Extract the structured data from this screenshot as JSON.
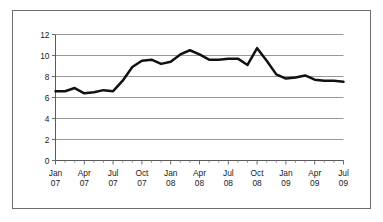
{
  "figure": {
    "background_color": "#ffffff",
    "frame_color": "#6e6e6e",
    "has_outer_border": true
  },
  "chart_data": {
    "type": "line",
    "title": "",
    "subtitle": "",
    "xlabel": "",
    "ylabel": "",
    "ylim": [
      0,
      12
    ],
    "y_ticks": [
      0,
      2,
      4,
      6,
      8,
      10,
      12
    ],
    "y_tick_labels": [
      "0",
      "2",
      "4",
      "6",
      "8",
      "10",
      "12"
    ],
    "grid": "horizontal",
    "legend": "none",
    "line_color": "#111111",
    "line_width": 2.5,
    "x_tick_labels": [
      {
        "month": "Jan",
        "year": "07"
      },
      {
        "month": "Apr",
        "year": "07"
      },
      {
        "month": "Jul",
        "year": "07"
      },
      {
        "month": "Oct",
        "year": "07"
      },
      {
        "month": "Jan",
        "year": "08"
      },
      {
        "month": "Apr",
        "year": "08"
      },
      {
        "month": "Jul",
        "year": "08"
      },
      {
        "month": "Oct",
        "year": "08"
      },
      {
        "month": "Jan",
        "year": "09"
      },
      {
        "month": "Apr",
        "year": "09"
      },
      {
        "month": "Jul",
        "year": "09"
      }
    ],
    "x": [
      "Jan 07",
      "Feb 07",
      "Mar 07",
      "Apr 07",
      "May 07",
      "Jun 07",
      "Jul 07",
      "Aug 07",
      "Sep 07",
      "Oct 07",
      "Nov 07",
      "Dec 07",
      "Jan 08",
      "Feb 08",
      "Mar 08",
      "Apr 08",
      "May 08",
      "Jun 08",
      "Jul 08",
      "Aug 08",
      "Sep 08",
      "Oct 08",
      "Nov 08",
      "Dec 08",
      "Jan 09",
      "Feb 09",
      "Mar 09",
      "Apr 09",
      "May 09",
      "Jun 09",
      "Jul 09"
    ],
    "values": [
      6.6,
      6.6,
      6.9,
      6.4,
      6.5,
      6.7,
      6.6,
      7.6,
      8.9,
      9.5,
      9.6,
      9.2,
      9.4,
      10.1,
      10.5,
      10.1,
      9.6,
      9.6,
      9.7,
      9.7,
      9.1,
      10.7,
      9.5,
      8.2,
      7.8,
      7.9,
      8.1,
      7.7,
      7.6,
      7.6,
      7.5
    ],
    "minor_ticks_per_label": 3
  }
}
